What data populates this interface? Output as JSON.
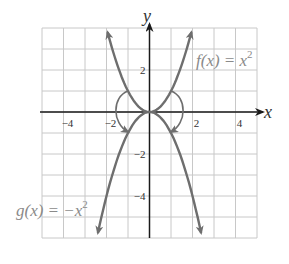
{
  "chart_data": {
    "type": "line",
    "title": "",
    "xlabel": "x",
    "ylabel": "y",
    "xlim": [
      -5,
      5
    ],
    "ylim": [
      -6,
      4
    ],
    "grid": true,
    "x_ticks": [
      {
        "value": -4,
        "label": "−4"
      },
      {
        "value": -2,
        "label": "−2"
      },
      {
        "value": 2,
        "label": "2"
      },
      {
        "value": 4,
        "label": "4"
      }
    ],
    "y_ticks": [
      {
        "value": 2,
        "label": "2"
      },
      {
        "value": -2,
        "label": "−2"
      },
      {
        "value": -4,
        "label": "−4"
      }
    ],
    "series": [
      {
        "name": "f(x) = x^2",
        "label_text": "f(x) = x",
        "label_exponent": "2",
        "expression": "x^2",
        "x": [
          -1.95,
          -1.5,
          -1,
          -0.5,
          0,
          0.5,
          1,
          1.5,
          1.95
        ],
        "values": [
          3.8,
          2.25,
          1,
          0.25,
          0,
          0.25,
          1,
          2.25,
          3.8
        ]
      },
      {
        "name": "g(x) = -x^2",
        "label_text": "g(x) = −x",
        "label_exponent": "2",
        "expression": "-x^2",
        "x": [
          -2.4,
          -2,
          -1.5,
          -1,
          -0.5,
          0,
          0.5,
          1,
          1.5,
          2,
          2.4
        ],
        "values": [
          -5.76,
          -4,
          -2.25,
          -1,
          -0.25,
          0,
          -0.25,
          -1,
          -2.25,
          -4,
          -5.76
        ]
      }
    ],
    "annotations": [
      {
        "type": "curved-arrow",
        "description": "reflection arrow from f to g on left side",
        "from": [
          -1,
          1
        ],
        "to": [
          -1,
          -1
        ]
      },
      {
        "type": "curved-arrow",
        "description": "reflection arrow from f to g on right side",
        "from": [
          1,
          1
        ],
        "to": [
          1,
          -1
        ]
      }
    ]
  },
  "colors": {
    "curve": "#6e6e6e",
    "axis": "#1a1a1a",
    "grid": "#c8c8c8",
    "label": "#8a8a8a"
  }
}
